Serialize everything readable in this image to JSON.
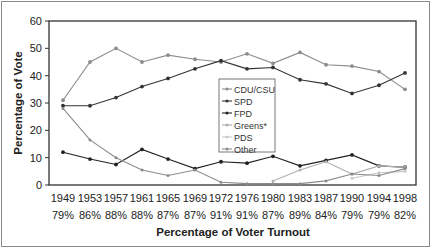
{
  "chart_data": {
    "type": "line",
    "title": "",
    "xlabel": "Percentage of Voter Turnout",
    "ylabel": "Percentage of Vote",
    "ylim": [
      0,
      60
    ],
    "yticks": [
      0,
      10,
      20,
      30,
      40,
      50,
      60
    ],
    "grid": false,
    "legend_position": "center-inside",
    "categories": [
      "1949",
      "1953",
      "1957",
      "1961",
      "1965",
      "1969",
      "1972",
      "1976",
      "1980",
      "1983",
      "1987",
      "1990",
      "1994",
      "1998"
    ],
    "turnout": [
      "79%",
      "86%",
      "88%",
      "88%",
      "87%",
      "87%",
      "91%",
      "91%",
      "87%",
      "89%",
      "84%",
      "79%",
      "79%",
      "82%"
    ],
    "series": [
      {
        "name": "CDU/CSU",
        "color": "#8c8c8c",
        "values": [
          31,
          45,
          50,
          45,
          47.5,
          46,
          45,
          48,
          44.5,
          48.5,
          44,
          43.5,
          41.5,
          35
        ]
      },
      {
        "name": "SPD",
        "color": "#333333",
        "values": [
          29,
          29,
          32,
          36,
          39,
          42.5,
          45.5,
          42.5,
          43,
          38.5,
          37,
          33.5,
          36.5,
          41
        ]
      },
      {
        "name": "FPD",
        "color": "#222222",
        "values": [
          12,
          9.5,
          7.5,
          13,
          9.5,
          6,
          8.5,
          8,
          10.5,
          7,
          9,
          11,
          7,
          6.5
        ]
      },
      {
        "name": "Greens*",
        "color": "#b0b0b0",
        "values": [
          null,
          null,
          null,
          null,
          null,
          null,
          null,
          null,
          1.5,
          5.5,
          8.5,
          4,
          7,
          6.5
        ]
      },
      {
        "name": "PDS",
        "color": "#c8c8c8",
        "values": [
          null,
          null,
          null,
          null,
          null,
          null,
          null,
          null,
          null,
          null,
          null,
          2.5,
          4.5,
          5
        ]
      },
      {
        "name": "Other",
        "color": "#8c8c8c",
        "values": [
          28,
          16.5,
          10,
          5.5,
          3.5,
          5.5,
          1,
          0.5,
          0.5,
          0.5,
          1.5,
          4,
          3.5,
          6
        ]
      }
    ]
  }
}
